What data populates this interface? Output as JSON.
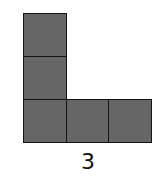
{
  "figure": {
    "shape": "L-tromino-pentomino",
    "cell_count": 5,
    "fill_color": "#666666",
    "border_color": "#141414",
    "cells": [
      {
        "col": 0,
        "row": 0
      },
      {
        "col": 0,
        "row": 1
      },
      {
        "col": 0,
        "row": 2
      },
      {
        "col": 1,
        "row": 2
      },
      {
        "col": 2,
        "row": 2
      }
    ],
    "label": "3"
  }
}
